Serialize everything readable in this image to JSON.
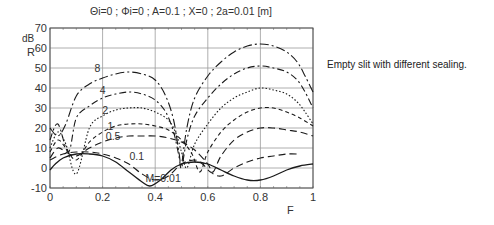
{
  "caption": "Empty slit with different sealing.",
  "chart_data": {
    "type": "line",
    "title": "Θi=0 ; Φi=0 ; A=0.1 ; X=0 ; 2a=0.01 [m]",
    "xlabel": "F",
    "ylabel_unit": "dB",
    "ylabel": "R",
    "xlim": [
      0,
      1
    ],
    "ylim": [
      -10,
      70
    ],
    "xticks": [
      "0",
      "0.2",
      "0.4",
      "0.6",
      "0.8",
      "1"
    ],
    "yticks": [
      "-10",
      "0",
      "10",
      "20",
      "30",
      "40",
      "50",
      "60",
      "70"
    ],
    "grid": true,
    "legend": "inline curve labels",
    "series": [
      {
        "name": "8",
        "label_pos": [
          0.18,
          48
        ],
        "style": "dashdot-long",
        "x": [
          0.0,
          0.03,
          0.06,
          0.1,
          0.15,
          0.2,
          0.25,
          0.3,
          0.35,
          0.4,
          0.44,
          0.47,
          0.49,
          0.5,
          0.52,
          0.55,
          0.6,
          0.65,
          0.7,
          0.75,
          0.8,
          0.85,
          0.9,
          0.94,
          0.97,
          1.0
        ],
        "y": [
          20,
          16,
          22,
          36,
          42,
          45,
          47,
          48,
          47,
          44,
          36,
          24,
          8,
          2,
          20,
          35,
          46,
          53,
          58,
          61,
          62,
          61,
          58,
          53,
          46,
          38
        ]
      },
      {
        "name": "4",
        "label_pos": [
          0.2,
          37
        ],
        "style": "dashdot",
        "x": [
          0.0,
          0.03,
          0.07,
          0.1,
          0.15,
          0.2,
          0.25,
          0.3,
          0.35,
          0.4,
          0.44,
          0.47,
          0.49,
          0.5,
          0.52,
          0.55,
          0.6,
          0.65,
          0.7,
          0.75,
          0.8,
          0.85,
          0.9,
          0.94,
          0.97,
          1.0
        ],
        "y": [
          14,
          22,
          8,
          25,
          31,
          35,
          37,
          38,
          37,
          34,
          28,
          18,
          6,
          0,
          14,
          26,
          35,
          42,
          47,
          50,
          51,
          50,
          48,
          44,
          38,
          30
        ]
      },
      {
        "name": "2",
        "label_pos": [
          0.21,
          27
        ],
        "style": "dotted",
        "x": [
          0.0,
          0.03,
          0.06,
          0.1,
          0.15,
          0.2,
          0.25,
          0.3,
          0.35,
          0.4,
          0.45,
          0.48,
          0.5,
          0.52,
          0.55,
          0.6,
          0.65,
          0.7,
          0.75,
          0.8,
          0.85,
          0.9,
          0.94,
          0.97,
          1.0
        ],
        "y": [
          10,
          18,
          12,
          -3,
          20,
          26,
          29,
          30,
          30,
          28,
          24,
          17,
          8,
          0,
          12,
          22,
          30,
          35,
          38,
          40,
          39,
          37,
          33,
          28,
          22
        ]
      },
      {
        "name": "1",
        "label_pos": [
          0.23,
          19
        ],
        "style": "dashed-short",
        "x": [
          0.0,
          0.03,
          0.06,
          0.1,
          0.15,
          0.2,
          0.25,
          0.3,
          0.35,
          0.4,
          0.45,
          0.5,
          0.54,
          0.57,
          0.6,
          0.65,
          0.7,
          0.75,
          0.8,
          0.85,
          0.9,
          0.95,
          1.0
        ],
        "y": [
          8,
          14,
          10,
          4,
          13,
          18,
          21,
          22,
          22,
          21,
          19,
          14,
          7,
          -2,
          8,
          18,
          24,
          28,
          30,
          30,
          28,
          25,
          21
        ]
      },
      {
        "name": "0.5",
        "label_pos": [
          0.24,
          14
        ],
        "style": "dashed-long",
        "x": [
          0.0,
          0.03,
          0.06,
          0.1,
          0.15,
          0.2,
          0.25,
          0.3,
          0.35,
          0.4,
          0.45,
          0.5,
          0.55,
          0.6,
          0.62,
          0.65,
          0.7,
          0.75,
          0.8,
          0.85,
          0.9,
          0.95,
          1.0
        ],
        "y": [
          5,
          10,
          8,
          6,
          10,
          13,
          15,
          16,
          16,
          16,
          15,
          13,
          9,
          2,
          -2,
          6,
          14,
          18,
          20,
          20,
          19,
          18,
          16
        ]
      },
      {
        "name": "0.1",
        "label_pos": [
          0.33,
          4
        ],
        "style": "dashed-long",
        "x": [
          0.0,
          0.05,
          0.1,
          0.15,
          0.2,
          0.25,
          0.3,
          0.35,
          0.4,
          0.45,
          0.5,
          0.55,
          0.58,
          0.61,
          0.65,
          0.7,
          0.75,
          0.8,
          0.85,
          0.9,
          0.95
        ],
        "y": [
          4,
          7,
          8,
          8,
          7,
          5,
          2,
          -3,
          -6,
          -4,
          2,
          4,
          2,
          -2,
          -4,
          0,
          3,
          5,
          6,
          7,
          7
        ]
      },
      {
        "name": "M=0.01",
        "label_pos": [
          0.43,
          -7
        ],
        "style": "solid",
        "x": [
          0.0,
          0.02,
          0.05,
          0.1,
          0.15,
          0.2,
          0.25,
          0.3,
          0.35,
          0.38,
          0.42,
          0.46,
          0.5,
          0.55,
          0.6,
          0.65,
          0.7,
          0.75,
          0.8,
          0.85,
          0.9,
          0.95,
          1.0
        ],
        "y": [
          -1,
          2,
          5,
          7,
          7,
          6,
          3,
          -2,
          -7,
          -9,
          -6,
          -1,
          2,
          3,
          2,
          -1,
          -4,
          -6,
          -6,
          -4,
          -1,
          1,
          2
        ]
      }
    ]
  }
}
